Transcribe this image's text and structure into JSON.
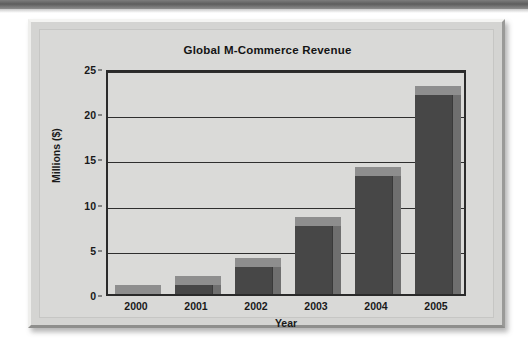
{
  "figure": {
    "frame_color": "#d4d4d2",
    "plot_bg_color": "#dadad8"
  },
  "chart_data": {
    "type": "bar",
    "title": "Global M-Commerce Revenue",
    "xlabel": "Year",
    "ylabel": "Millions ($)",
    "categories": [
      "2000",
      "2001",
      "2002",
      "2003",
      "2004",
      "2005"
    ],
    "values": [
      1,
      2,
      4,
      8.5,
      14,
      23
    ],
    "ylim": [
      0,
      25
    ],
    "yticks": [
      0,
      5,
      10,
      15,
      20,
      25
    ],
    "ytick_labels": [
      "0",
      "5",
      "10",
      "15",
      "20",
      "25"
    ],
    "grid": true,
    "legend": null,
    "bar_style": "3d",
    "bar_face_color": "#474747",
    "bar_top_color": "#8e8e8e",
    "bar_side_color": "#6f6f6f",
    "axis_color": "#2a2a2a"
  }
}
